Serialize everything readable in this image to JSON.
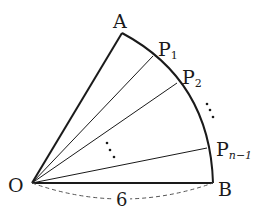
{
  "diagram": {
    "points": {
      "O": {
        "label": "O",
        "x": 32,
        "y": 183
      },
      "A": {
        "label": "A",
        "x": 122,
        "y": 33
      },
      "B": {
        "label": "B",
        "x": 213,
        "y": 183
      },
      "P1": {
        "label": "P",
        "sub": "1",
        "x": 153,
        "y": 56
      },
      "P2": {
        "label": "P",
        "sub": "2",
        "x": 177,
        "y": 83
      },
      "Pn1": {
        "label": "P",
        "sub": "n−1",
        "x": 207,
        "y": 148
      }
    },
    "radius_label": "6",
    "colors": {
      "line": "#1a1a1a",
      "dash": "#555555",
      "background": "#ffffff"
    }
  }
}
